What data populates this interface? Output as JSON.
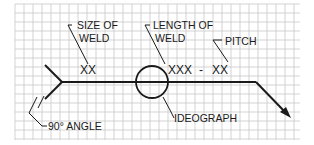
{
  "diagram": {
    "type": "welding-symbol",
    "grid": {
      "x0": 15,
      "y0": 4,
      "x1": 300,
      "y1": 140,
      "cell": 9,
      "line_color": "#c8c8c8",
      "background": "#ffffff"
    },
    "ink_color": "#1a1a1a",
    "labels": {
      "size_of_weld_line1": "SIZE OF",
      "size_of_weld_line2": "WELD",
      "length_of_weld_line1": "LENGTH OF",
      "length_of_weld_line2": "WELD",
      "pitch": "PITCH",
      "angle": "90° ANGLE",
      "ideograph": "IDEOGRAPH"
    },
    "values": {
      "size": "XX",
      "length": "XXX",
      "separator": "-",
      "pitch": "XX"
    }
  }
}
